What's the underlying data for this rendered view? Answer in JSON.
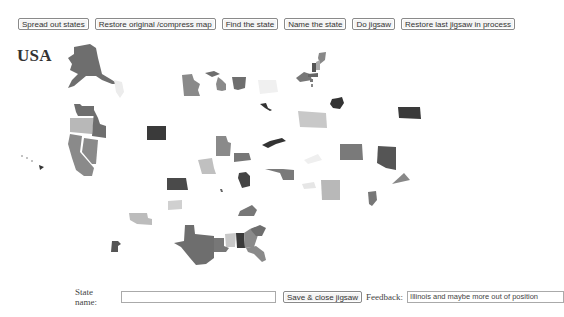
{
  "toolbar": {
    "buttons": [
      {
        "label": "Spread out states"
      },
      {
        "label": "Restore original /compress map"
      },
      {
        "label": "Find the state"
      },
      {
        "label": "Name the state"
      },
      {
        "label": "Do jigsaw"
      },
      {
        "label": "Restore last jigsaw in process"
      }
    ]
  },
  "map": {
    "title": "USA",
    "colors": {
      "dark": "#3a3a3a",
      "mid": "#6e6e6e",
      "medium": "#8a8a8a",
      "light": "#b8b8b8",
      "faint": "#ececec"
    }
  },
  "form": {
    "state_name_label": "State name:",
    "state_name_value": "",
    "save_button_label": "Save & close jigsaw",
    "feedback_label": "Feedback:",
    "feedback_value": "Illinois and maybe more out of position"
  }
}
